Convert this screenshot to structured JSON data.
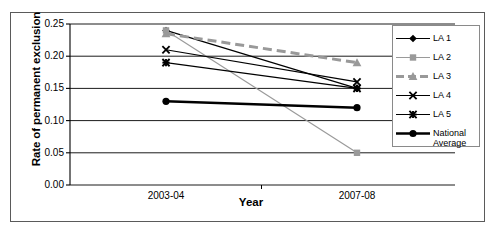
{
  "chart_data": {
    "type": "line",
    "title": "",
    "xlabel": "Year",
    "ylabel": "Rate of permanent exclusion",
    "categories": [
      "2003-04",
      "2007-08"
    ],
    "x_tick_labels": [
      "2003-04",
      "2007-08"
    ],
    "y_tick_labels": [
      "0.00",
      "0.05",
      "0.10",
      "0.15",
      "0.20",
      "0.25"
    ],
    "y_ticks": [
      0.0,
      0.05,
      0.1,
      0.15,
      0.2,
      0.25
    ],
    "ylim": [
      0.0,
      0.25
    ],
    "grid": "horizontal",
    "legend_position": "right",
    "series": [
      {
        "name": "LA 1",
        "values": [
          0.24,
          0.15
        ],
        "color": "#000000",
        "marker": "diamond",
        "line_style": "solid",
        "line_width": 1.2
      },
      {
        "name": "LA 2",
        "values": [
          0.24,
          0.05
        ],
        "color": "#9a9a9a",
        "marker": "square",
        "line_style": "solid",
        "line_width": 1.2
      },
      {
        "name": "LA 3",
        "values": [
          0.235,
          0.19
        ],
        "color": "#999999",
        "marker": "triangle",
        "line_style": "dashed",
        "line_width": 3
      },
      {
        "name": "LA 4",
        "values": [
          0.21,
          0.16
        ],
        "color": "#000000",
        "marker": "x",
        "line_style": "solid",
        "line_width": 1.2
      },
      {
        "name": "LA 5",
        "values": [
          0.19,
          0.15
        ],
        "color": "#000000",
        "marker": "star",
        "line_style": "solid",
        "line_width": 1.2
      },
      {
        "name": "National\nAverage",
        "values": [
          0.13,
          0.12
        ],
        "color": "#000000",
        "marker": "circle",
        "line_style": "solid",
        "line_width": 2.4
      }
    ]
  },
  "legend": {
    "entries": [
      {
        "label": "LA 1"
      },
      {
        "label": "LA 2"
      },
      {
        "label": "LA 3"
      },
      {
        "label": "LA 4"
      },
      {
        "label": "LA 5"
      },
      {
        "label": "National\nAverage"
      }
    ]
  },
  "colors": {
    "axis": "#000000",
    "grid": "#000000",
    "frame": "#5a5a5a",
    "background": "#ffffff",
    "gray_series": "#9a9a9a"
  }
}
